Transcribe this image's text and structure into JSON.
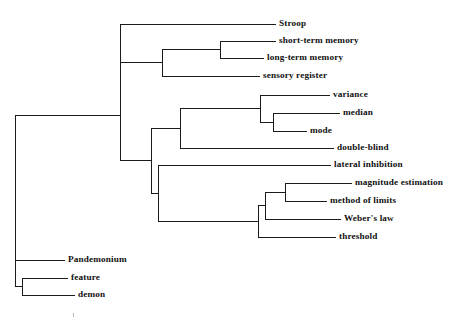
{
  "figure": {
    "type": "dendrogram",
    "orientation": "horizontal-left-root",
    "title": "",
    "background_color": "#ffffff",
    "line_color": "#1a1a1a",
    "text_color": "#101010"
  },
  "chart_data": {
    "type": "tree",
    "title": "",
    "xlabel": "",
    "ylabel": "",
    "grid": false,
    "legend": "none",
    "leaves": [
      {
        "id": "stroop",
        "label": "Stroop",
        "x": 279,
        "y": 24
      },
      {
        "id": "short-term-memory",
        "label": "short-term memory",
        "x": 279,
        "y": 41
      },
      {
        "id": "long-term-memory",
        "label": "long-term memory",
        "x": 267,
        "y": 58
      },
      {
        "id": "sensory-register",
        "label": "sensory register",
        "x": 263,
        "y": 76
      },
      {
        "id": "variance",
        "label": "variance",
        "x": 333,
        "y": 95
      },
      {
        "id": "median",
        "label": "median",
        "x": 343,
        "y": 113
      },
      {
        "id": "mode",
        "label": "mode",
        "x": 310,
        "y": 131
      },
      {
        "id": "double-blind",
        "label": "double-blind",
        "x": 337,
        "y": 148
      },
      {
        "id": "lateral-inhibition",
        "label": "lateral inhibition",
        "x": 334,
        "y": 165
      },
      {
        "id": "magnitude-estimation",
        "label": "magnitude estimation",
        "x": 355,
        "y": 183
      },
      {
        "id": "method-of-limits",
        "label": "method of limits",
        "x": 330,
        "y": 201
      },
      {
        "id": "webers-law",
        "label": "Weber's law",
        "x": 344,
        "y": 219
      },
      {
        "id": "threshold",
        "label": "threshold",
        "x": 339,
        "y": 237
      },
      {
        "id": "pandemonium",
        "label": "Pandemonium",
        "x": 68,
        "y": 260
      },
      {
        "id": "feature",
        "label": "feature",
        "x": 71,
        "y": 278
      },
      {
        "id": "demon",
        "label": "demon",
        "x": 78,
        "y": 295
      }
    ],
    "links": [
      {
        "id": "link-stm-ltm",
        "x": 220,
        "y1": 41,
        "y2": 58,
        "stubs": [
          {
            "y": 41,
            "x_to": 276
          },
          {
            "y": 58,
            "x_to": 264
          }
        ]
      },
      {
        "id": "link-memory-sensory",
        "x": 162,
        "y1": 49.5,
        "y2": 76,
        "stubs": [
          {
            "y": 49.5,
            "x_to": 220
          },
          {
            "y": 76,
            "x_to": 260
          }
        ]
      },
      {
        "id": "link-cognition",
        "x": 120,
        "y1": 24,
        "y2": 62.7,
        "stubs": [
          {
            "y": 24,
            "x_to": 276
          },
          {
            "y": 62.7,
            "x_to": 162
          }
        ]
      },
      {
        "id": "link-median-mode",
        "x": 273,
        "y1": 113,
        "y2": 131,
        "stubs": [
          {
            "y": 113,
            "x_to": 340
          },
          {
            "y": 131,
            "x_to": 307
          }
        ]
      },
      {
        "id": "link-variance-stats",
        "x": 260,
        "y1": 95,
        "y2": 122,
        "stubs": [
          {
            "y": 95,
            "x_to": 330
          },
          {
            "y": 122,
            "x_to": 273
          }
        ]
      },
      {
        "id": "link-stats-doubleblind",
        "x": 180,
        "y1": 108.5,
        "y2": 148,
        "stubs": [
          {
            "y": 108.5,
            "x_to": 260
          },
          {
            "y": 148,
            "x_to": 334
          }
        ]
      },
      {
        "id": "link-magnitude-method",
        "x": 285,
        "y1": 183,
        "y2": 201,
        "stubs": [
          {
            "y": 183,
            "x_to": 352
          },
          {
            "y": 201,
            "x_to": 327
          }
        ]
      },
      {
        "id": "link-psycho-weber",
        "x": 265,
        "y1": 192,
        "y2": 219,
        "stubs": [
          {
            "y": 192,
            "x_to": 285
          },
          {
            "y": 219,
            "x_to": 341
          }
        ]
      },
      {
        "id": "link-psycho-threshold",
        "x": 258,
        "y1": 205.5,
        "y2": 237,
        "stubs": [
          {
            "y": 205.5,
            "x_to": 265
          },
          {
            "y": 237,
            "x_to": 336
          }
        ]
      },
      {
        "id": "link-lateral-psycho",
        "x": 158,
        "y1": 165,
        "y2": 221.3,
        "stubs": [
          {
            "y": 165,
            "x_to": 331
          },
          {
            "y": 221.3,
            "x_to": 258
          }
        ]
      },
      {
        "id": "link-stats-sensation",
        "x": 151,
        "y1": 128.3,
        "y2": 193.1,
        "stubs": [
          {
            "y": 128.3,
            "x_to": 180
          },
          {
            "y": 193.1,
            "x_to": 158
          }
        ]
      },
      {
        "id": "link-upper-root",
        "x": 120,
        "y1": 62.7,
        "y2": 160.7,
        "stubs": [
          {
            "y": 160.7,
            "x_to": 151
          }
        ]
      },
      {
        "id": "link-feature-demon",
        "x": 22,
        "y1": 278,
        "y2": 295,
        "stubs": [
          {
            "y": 278,
            "x_to": 68
          },
          {
            "y": 295,
            "x_to": 75
          }
        ]
      },
      {
        "id": "link-pandemonium-group",
        "x": 15,
        "y1": 260,
        "y2": 286.5,
        "stubs": [
          {
            "y": 260,
            "x_to": 65
          },
          {
            "y": 286.5,
            "x_to": 22
          }
        ]
      },
      {
        "id": "link-root",
        "x": 15,
        "y1": 115,
        "y2": 260,
        "stubs": [
          {
            "y": 115,
            "x_to": 120
          }
        ]
      }
    ],
    "clusters": [
      {
        "id": "memory-cluster",
        "members": [
          "short-term memory",
          "long-term memory"
        ]
      },
      {
        "id": "memory-sensory-cluster",
        "members": [
          "short-term memory",
          "long-term memory",
          "sensory register"
        ]
      },
      {
        "id": "cognition-cluster",
        "members": [
          "Stroop",
          "short-term memory",
          "long-term memory",
          "sensory register"
        ]
      },
      {
        "id": "central-tendency-cluster",
        "members": [
          "median",
          "mode"
        ]
      },
      {
        "id": "statistics-cluster",
        "members": [
          "variance",
          "median",
          "mode"
        ]
      },
      {
        "id": "methodology-cluster",
        "members": [
          "variance",
          "median",
          "mode",
          "double-blind"
        ]
      },
      {
        "id": "scaling-cluster",
        "members": [
          "magnitude estimation",
          "method of limits"
        ]
      },
      {
        "id": "psychophysics-cluster",
        "members": [
          "magnitude estimation",
          "method of limits",
          "Weber's law",
          "threshold"
        ]
      },
      {
        "id": "sensation-cluster",
        "members": [
          "lateral inhibition",
          "magnitude estimation",
          "method of limits",
          "Weber's law",
          "threshold"
        ]
      },
      {
        "id": "pandemonium-cluster",
        "members": [
          "Pandemonium",
          "feature",
          "demon"
        ]
      }
    ]
  },
  "artifacts": [
    {
      "id": "speck",
      "x": 73,
      "y": 313,
      "w": 1,
      "h": 4
    }
  ]
}
